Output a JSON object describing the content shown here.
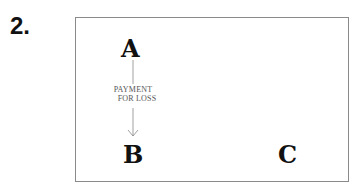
{
  "figure": {
    "number": "2."
  },
  "diagram": {
    "nodes": [
      {
        "id": "A",
        "label": "A"
      },
      {
        "id": "B",
        "label": "B"
      },
      {
        "id": "C",
        "label": "C"
      }
    ],
    "edges": [
      {
        "from": "A",
        "to": "B",
        "label_line1": "PAYMENT",
        "label_line2": "FOR LOSS"
      }
    ],
    "colors": {
      "node_text": "#111111",
      "edge": "#888888",
      "edge_label": "#555555",
      "border": "#8a8a8a"
    }
  }
}
